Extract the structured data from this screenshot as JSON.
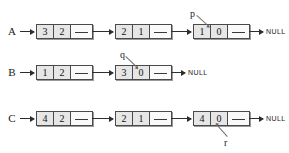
{
  "diagram": {
    "null_terminator": "NULL",
    "colors": {
      "node_fill": "#e6e6e6",
      "node_border": "#4a4a4a",
      "pointer_cell_fill": "#fafafa",
      "arrow": "#2e2e2e",
      "leader": "#6b6b6b",
      "text": "#1a1a1a",
      "background": "#ffffff"
    },
    "rows": [
      {
        "label": "A",
        "y": 31,
        "label_x": 12,
        "head_arrow": {
          "x": 24,
          "width": 12
        },
        "nodes": [
          {
            "x": 36,
            "cells": [
              "3",
              "2"
            ],
            "pointer_cell": ""
          },
          {
            "x": 115,
            "cells": [
              "2",
              "1"
            ],
            "pointer_cell": ""
          },
          {
            "x": 193,
            "cells": [
              "1",
              "0"
            ],
            "pointer_cell": ""
          }
        ],
        "links": [
          {
            "x": 92,
            "width": 23
          },
          {
            "x": 171,
            "width": 22
          },
          {
            "x": 249,
            "width": 16
          }
        ],
        "null_label": {
          "text": "NULL",
          "x": 266,
          "y": 28
        },
        "pointer_var": {
          "name": "p",
          "label_x": 190,
          "label_y": 10,
          "leader_x": 197,
          "leader_y": 15,
          "leader_len": 16,
          "leader_angle": 42
        }
      },
      {
        "label": "B",
        "y": 72,
        "label_x": 12,
        "head_arrow": {
          "x": 24,
          "width": 12
        },
        "nodes": [
          {
            "x": 36,
            "cells": [
              "1",
              "2"
            ],
            "pointer_cell": ""
          },
          {
            "x": 115,
            "cells": [
              "3",
              "0"
            ],
            "pointer_cell": ""
          }
        ],
        "links": [
          {
            "x": 92,
            "width": 23
          },
          {
            "x": 171,
            "width": 16
          }
        ],
        "null_label": {
          "text": "NULL",
          "x": 188,
          "y": 69
        },
        "pointer_var": {
          "name": "q",
          "label_x": 120,
          "label_y": 51,
          "leader_x": 126,
          "leader_y": 56,
          "leader_len": 16,
          "leader_angle": 44
        }
      },
      {
        "label": "C",
        "y": 118,
        "label_x": 12,
        "head_arrow": {
          "x": 24,
          "width": 12
        },
        "nodes": [
          {
            "x": 36,
            "cells": [
              "4",
              "2"
            ],
            "pointer_cell": ""
          },
          {
            "x": 115,
            "cells": [
              "2",
              "1"
            ],
            "pointer_cell": ""
          },
          {
            "x": 193,
            "cells": [
              "4",
              "0"
            ],
            "pointer_cell": ""
          }
        ],
        "links": [
          {
            "x": 92,
            "width": 23
          },
          {
            "x": 171,
            "width": 22
          },
          {
            "x": 249,
            "width": 16
          }
        ],
        "null_label": {
          "text": "NULL",
          "x": 266,
          "y": 115
        },
        "pointer_var": {
          "name": "r",
          "label_x": 224,
          "label_y": 139,
          "leader_x": 227,
          "leader_y": 138,
          "leader_len": 16,
          "leader_angle": -132
        }
      }
    ]
  }
}
